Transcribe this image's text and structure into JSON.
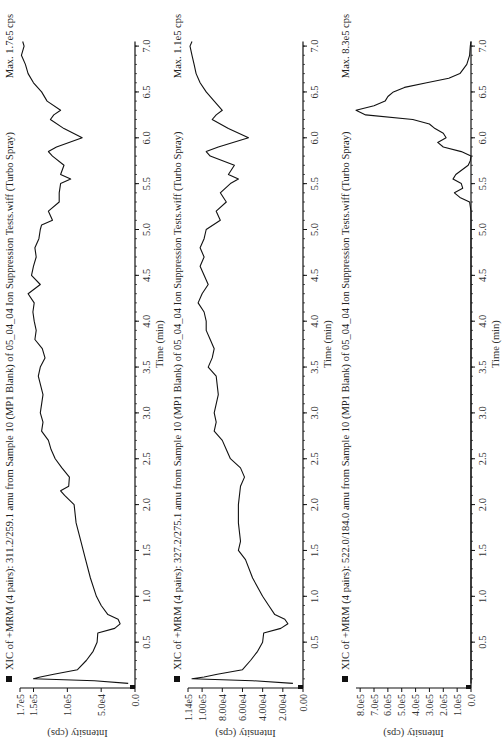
{
  "orientation": "rotated-90-ccw",
  "chart_data": [
    {
      "type": "line",
      "title": "XIC of +MRM (4 pairs): 311.2/259.1 amu from Sample 10 (MP1 Blank) of 05_04_04 Ion Suppression Tests.wiff (Turbo Spray)",
      "max_label": "Max. 1.7e5 cps",
      "xlabel": "Time (min)",
      "ylabel": "Intensity (cps)",
      "xlim": [
        0,
        7.1
      ],
      "ylim": [
        0,
        170000
      ],
      "x_ticks": [
        "0.5",
        "1.0",
        "1.5",
        "2.0",
        "2.5",
        "3.0",
        "3.5",
        "4.0",
        "4.5",
        "5.0",
        "5.5",
        "6.0",
        "6.5",
        "7.0"
      ],
      "y_ticks": [
        {
          "v": 0,
          "label": "0.0"
        },
        {
          "v": 50000,
          "label": "5.0e4"
        },
        {
          "v": 100000,
          "label": "1.0e5"
        },
        {
          "v": 150000,
          "label": "1.5e5"
        },
        {
          "v": 170000,
          "label": "1.7e5"
        }
      ],
      "x": [
        0.05,
        0.08,
        0.1,
        0.12,
        0.15,
        0.2,
        0.3,
        0.4,
        0.5,
        0.6,
        0.65,
        0.7,
        0.75,
        0.8,
        0.9,
        1.0,
        1.2,
        1.4,
        1.6,
        1.8,
        2.0,
        2.1,
        2.15,
        2.2,
        2.3,
        2.4,
        2.5,
        2.6,
        2.7,
        2.8,
        2.9,
        3.0,
        3.2,
        3.4,
        3.5,
        3.6,
        3.7,
        3.8,
        3.9,
        4.0,
        4.1,
        4.2,
        4.3,
        4.4,
        4.5,
        4.6,
        4.7,
        4.8,
        4.9,
        5.0,
        5.05,
        5.1,
        5.2,
        5.3,
        5.4,
        5.5,
        5.55,
        5.6,
        5.7,
        5.8,
        5.85,
        5.9,
        6.0,
        6.1,
        6.2,
        6.25,
        6.3,
        6.4,
        6.5,
        6.6,
        6.7,
        6.8,
        6.9,
        7.0,
        7.05
      ],
      "values": [
        10000,
        60000,
        150000,
        140000,
        120000,
        85000,
        72000,
        62000,
        56000,
        55000,
        30000,
        22000,
        25000,
        40000,
        50000,
        57000,
        66000,
        73000,
        80000,
        87000,
        90000,
        104000,
        110000,
        98000,
        97000,
        108000,
        118000,
        124000,
        128000,
        138000,
        136000,
        140000,
        136000,
        143000,
        140000,
        133000,
        137000,
        148000,
        146000,
        149000,
        151000,
        149000,
        158000,
        140000,
        153000,
        150000,
        146000,
        148000,
        142000,
        140000,
        138000,
        122000,
        128000,
        112000,
        112000,
        110000,
        95000,
        110000,
        105000,
        122000,
        128000,
        116000,
        78000,
        105000,
        125000,
        120000,
        110000,
        130000,
        138000,
        150000,
        158000,
        162000,
        168000,
        164000,
        166000
      ]
    },
    {
      "type": "line",
      "title": "XIC of +MRM (4 pairs): 327.2/275.1 amu from Sample 10 (MP1 Blank) of 05_04_04 Ion Suppression Tests.wiff (Turbo Spray)",
      "max_label": "Max. 1.1e5 cps",
      "xlabel": "Time (min)",
      "ylabel": "Intensity (cps)",
      "xlim": [
        0,
        7.1
      ],
      "ylim": [
        0,
        114000
      ],
      "x_ticks": [
        "0.5",
        "1.0",
        "1.5",
        "2.0",
        "2.5",
        "3.0",
        "3.5",
        "4.0",
        "4.5",
        "5.0",
        "5.5",
        "6.0",
        "6.5",
        "7.0"
      ],
      "y_ticks": [
        {
          "v": 0,
          "label": "0.00"
        },
        {
          "v": 20000,
          "label": "2.00e4"
        },
        {
          "v": 40000,
          "label": "4.00e4"
        },
        {
          "v": 60000,
          "label": "6.00e4"
        },
        {
          "v": 80000,
          "label": "8.00e4"
        },
        {
          "v": 100000,
          "label": "1.00e5"
        },
        {
          "v": 114000,
          "label": "1.14e5"
        }
      ],
      "x": [
        0.05,
        0.08,
        0.1,
        0.12,
        0.15,
        0.2,
        0.3,
        0.4,
        0.5,
        0.6,
        0.65,
        0.7,
        0.75,
        0.8,
        0.9,
        1.0,
        1.2,
        1.4,
        1.5,
        1.6,
        1.8,
        2.0,
        2.2,
        2.3,
        2.4,
        2.5,
        2.6,
        2.7,
        2.8,
        2.9,
        3.0,
        3.2,
        3.4,
        3.5,
        3.6,
        3.7,
        3.8,
        3.9,
        4.0,
        4.1,
        4.2,
        4.3,
        4.4,
        4.5,
        4.6,
        4.7,
        4.8,
        4.9,
        5.0,
        5.1,
        5.2,
        5.3,
        5.4,
        5.5,
        5.55,
        5.6,
        5.7,
        5.8,
        5.85,
        5.9,
        6.0,
        6.1,
        6.2,
        6.25,
        6.3,
        6.4,
        6.5,
        6.6,
        6.7,
        6.8,
        6.9,
        7.0,
        7.05
      ],
      "values": [
        10000,
        50000,
        110000,
        98000,
        85000,
        60000,
        52000,
        45000,
        40000,
        39000,
        22000,
        15000,
        18000,
        28000,
        34000,
        40000,
        50000,
        57000,
        64000,
        62000,
        64000,
        64000,
        62000,
        58000,
        62000,
        72000,
        76000,
        80000,
        88000,
        86000,
        88000,
        84000,
        86000,
        94000,
        90000,
        88000,
        92000,
        96000,
        96000,
        98000,
        104000,
        100000,
        94000,
        98000,
        102000,
        98000,
        102000,
        98000,
        96000,
        82000,
        86000,
        76000,
        82000,
        72000,
        64000,
        74000,
        68000,
        92000,
        96000,
        84000,
        54000,
        74000,
        90000,
        86000,
        80000,
        88000,
        96000,
        102000,
        106000,
        108000,
        110000,
        112000,
        110000
      ]
    },
    {
      "type": "line",
      "title": "XIC of +MRM (4 pairs): 522.0/184.0 amu from Sample 10 (MP1 Blank) of 05_04_04 Ion Suppression Tests.wiff (Turbo Spray)",
      "max_label": "Max. 8.3e5 cps",
      "xlabel": "Time (min)",
      "ylabel": "Intensity (cps)",
      "xlim": [
        0,
        7.1
      ],
      "ylim": [
        0,
        830000
      ],
      "x_ticks": [
        "0.5",
        "1.0",
        "1.5",
        "2.0",
        "2.5",
        "3.0",
        "3.5",
        "4.0",
        "4.5",
        "5.0",
        "5.5",
        "6.0",
        "6.5",
        "7.0"
      ],
      "y_ticks": [
        {
          "v": 0,
          "label": "0.0"
        },
        {
          "v": 100000,
          "label": "1.0e5"
        },
        {
          "v": 200000,
          "label": "2.0e5"
        },
        {
          "v": 300000,
          "label": "3.0e5"
        },
        {
          "v": 400000,
          "label": "4.0e5"
        },
        {
          "v": 500000,
          "label": "5.0e5"
        },
        {
          "v": 600000,
          "label": "6.0e5"
        },
        {
          "v": 700000,
          "label": "7.0e5"
        },
        {
          "v": 800000,
          "label": "8.0e5"
        }
      ],
      "x": [
        0.05,
        1.0,
        2.0,
        3.0,
        4.0,
        5.0,
        5.2,
        5.3,
        5.35,
        5.4,
        5.45,
        5.5,
        5.55,
        5.6,
        5.7,
        5.75,
        5.8,
        5.85,
        5.9,
        5.95,
        6.0,
        6.05,
        6.1,
        6.15,
        6.2,
        6.25,
        6.3,
        6.35,
        6.4,
        6.45,
        6.5,
        6.55,
        6.6,
        6.65,
        6.7,
        6.8,
        6.9,
        7.0,
        7.05
      ],
      "values": [
        0,
        0,
        0,
        0,
        0,
        0,
        0,
        10000,
        80000,
        120000,
        60000,
        70000,
        130000,
        110000,
        20000,
        5000,
        0,
        70000,
        200000,
        240000,
        180000,
        200000,
        260000,
        300000,
        420000,
        760000,
        830000,
        700000,
        620000,
        600000,
        560000,
        480000,
        320000,
        160000,
        80000,
        30000,
        10000,
        5000,
        0
      ]
    }
  ]
}
